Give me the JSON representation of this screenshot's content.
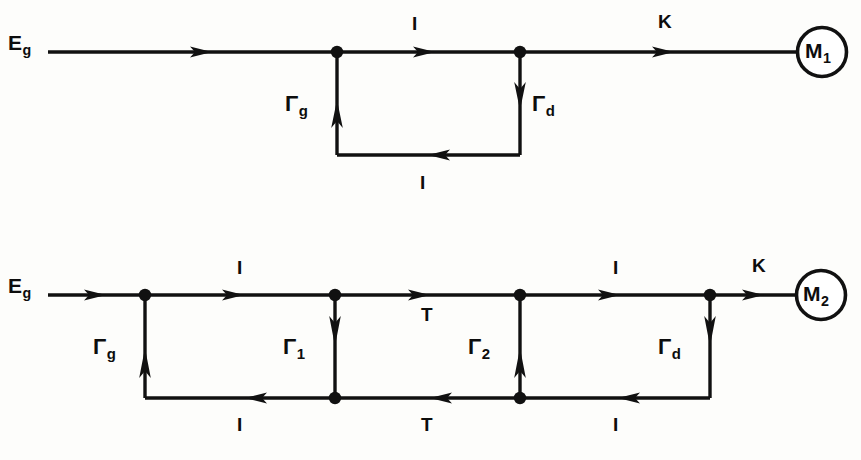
{
  "figure": {
    "type": "signal-flow-graph",
    "line_color": "#111111",
    "background_color": "#fdfdfb"
  },
  "graphs": [
    {
      "id": "graph-1",
      "name": "upper-signal-flow-graph",
      "source": {
        "label": "E",
        "sub": "g"
      },
      "sink": {
        "label": "M",
        "sub": "1"
      },
      "forward_branches": [
        {
          "name": "branch-source-to-n1",
          "gain": "",
          "sub": "",
          "direction": "right"
        },
        {
          "name": "branch-n1-to-n2",
          "gain": "I",
          "sub": "",
          "direction": "right"
        },
        {
          "name": "branch-n2-to-sink",
          "gain": "K",
          "sub": "",
          "direction": "right"
        }
      ],
      "vertical_branches": [
        {
          "name": "branch-gamma-g",
          "gain": "Γ",
          "sub": "g",
          "direction": "up"
        },
        {
          "name": "branch-gamma-d",
          "gain": "Γ",
          "sub": "d",
          "direction": "down"
        }
      ],
      "return_branches": [
        {
          "name": "branch-return-n2-to-n1",
          "gain": "I",
          "sub": "",
          "direction": "left"
        }
      ]
    },
    {
      "id": "graph-2",
      "name": "lower-signal-flow-graph",
      "source": {
        "label": "E",
        "sub": "g"
      },
      "sink": {
        "label": "M",
        "sub": "2"
      },
      "forward_branches": [
        {
          "name": "branch-source-to-n1",
          "gain": "",
          "sub": "",
          "direction": "right"
        },
        {
          "name": "branch-n1-to-n2",
          "gain": "I",
          "sub": "",
          "direction": "right"
        },
        {
          "name": "branch-n2-to-n3",
          "gain": "T",
          "sub": "",
          "direction": "right"
        },
        {
          "name": "branch-n3-to-n4",
          "gain": "I",
          "sub": "",
          "direction": "right"
        },
        {
          "name": "branch-n4-to-sink",
          "gain": "K",
          "sub": "",
          "direction": "right"
        }
      ],
      "vertical_branches": [
        {
          "name": "branch-gamma-g",
          "gain": "Γ",
          "sub": "g",
          "direction": "up"
        },
        {
          "name": "branch-gamma-1",
          "gain": "Γ",
          "sub": "1",
          "direction": "down"
        },
        {
          "name": "branch-gamma-2",
          "gain": "Γ",
          "sub": "2",
          "direction": "up"
        },
        {
          "name": "branch-gamma-d",
          "gain": "Γ",
          "sub": "d",
          "direction": "down"
        }
      ],
      "return_branches": [
        {
          "name": "branch-return-b2-to-b1",
          "gain": "I",
          "sub": "",
          "direction": "left"
        },
        {
          "name": "branch-return-b3-to-b2",
          "gain": "T",
          "sub": "",
          "direction": "left"
        },
        {
          "name": "branch-return-b4-to-b3",
          "gain": "I",
          "sub": "",
          "direction": "left"
        }
      ]
    }
  ],
  "labels": {
    "g1_source": "E",
    "g1_source_sub": "g",
    "g1_top_I": "I",
    "g1_top_K": "K",
    "g1_gamma_g": "Γ",
    "g1_gamma_g_sub": "g",
    "g1_gamma_d": "Γ",
    "g1_gamma_d_sub": "d",
    "g1_bottom_I": "I",
    "g1_sink": "M",
    "g1_sink_sub": "1",
    "g2_source": "E",
    "g2_source_sub": "g",
    "g2_top_I1": "I",
    "g2_top_T": "T",
    "g2_top_I2": "I",
    "g2_top_K": "K",
    "g2_gamma_g": "Γ",
    "g2_gamma_g_sub": "g",
    "g2_gamma_1": "Γ",
    "g2_gamma_1_sub": "1",
    "g2_gamma_2": "Γ",
    "g2_gamma_2_sub": "2",
    "g2_gamma_d": "Γ",
    "g2_gamma_d_sub": "d",
    "g2_bottom_I1": "I",
    "g2_bottom_T": "T",
    "g2_bottom_I2": "I",
    "g2_sink": "M",
    "g2_sink_sub": "2"
  }
}
